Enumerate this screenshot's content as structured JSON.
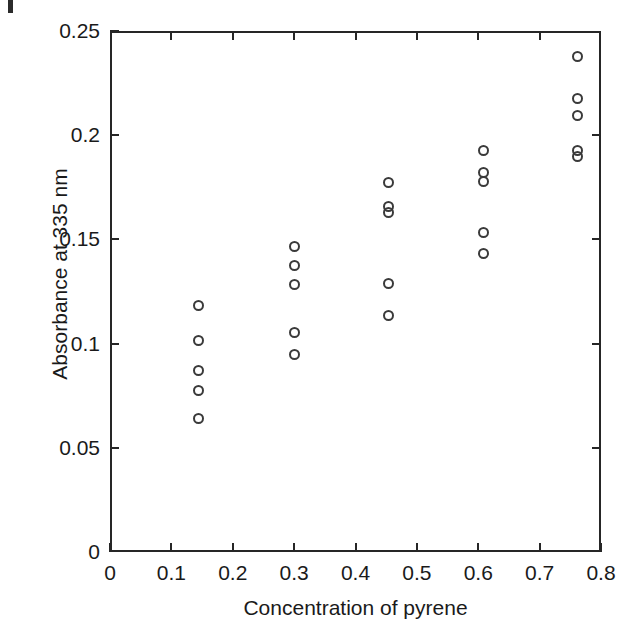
{
  "chart_data": {
    "type": "scatter",
    "title": "",
    "xlabel": "Concentration of pyrene",
    "ylabel": "Absorbance at 335 nm",
    "xlim": [
      0,
      0.8
    ],
    "ylim": [
      0,
      0.25
    ],
    "xticks": [
      0,
      0.1,
      0.2,
      0.3,
      0.4,
      0.5,
      0.6,
      0.7,
      0.8
    ],
    "xticklabels": [
      "0",
      "0.1",
      "0.2",
      "0.3",
      "0.4",
      "0.5",
      "0.6",
      "0.7",
      "0.8"
    ],
    "yticks": [
      0,
      0.05,
      0.1,
      0.15,
      0.2,
      0.25
    ],
    "yticklabels": [
      "0",
      "0.05",
      "0.1",
      "0.15",
      "0.2",
      "0.25"
    ],
    "grid": false,
    "legend": null,
    "marker": "open-circle",
    "marker_color": "#3a3a3a",
    "points": [
      {
        "x": 0.145,
        "y": 0.1185
      },
      {
        "x": 0.145,
        "y": 0.1015
      },
      {
        "x": 0.145,
        "y": 0.087
      },
      {
        "x": 0.145,
        "y": 0.0775
      },
      {
        "x": 0.145,
        "y": 0.064
      },
      {
        "x": 0.3,
        "y": 0.1465
      },
      {
        "x": 0.3,
        "y": 0.1375
      },
      {
        "x": 0.3,
        "y": 0.1285
      },
      {
        "x": 0.3,
        "y": 0.1055
      },
      {
        "x": 0.3,
        "y": 0.095
      },
      {
        "x": 0.453,
        "y": 0.1775
      },
      {
        "x": 0.453,
        "y": 0.166
      },
      {
        "x": 0.453,
        "y": 0.163
      },
      {
        "x": 0.453,
        "y": 0.129
      },
      {
        "x": 0.453,
        "y": 0.1135
      },
      {
        "x": 0.608,
        "y": 0.1925
      },
      {
        "x": 0.608,
        "y": 0.182
      },
      {
        "x": 0.608,
        "y": 0.178
      },
      {
        "x": 0.608,
        "y": 0.1535
      },
      {
        "x": 0.608,
        "y": 0.143
      },
      {
        "x": 0.762,
        "y": 0.238
      },
      {
        "x": 0.762,
        "y": 0.2175
      },
      {
        "x": 0.762,
        "y": 0.2095
      },
      {
        "x": 0.762,
        "y": 0.1925
      },
      {
        "x": 0.762,
        "y": 0.19
      }
    ],
    "series_note": "Five concentration levels with five replicate absorbance readings each"
  },
  "axes": {
    "x_title": "Concentration of pyrene",
    "y_title": "Absorbance at 335 nm"
  },
  "colors": {
    "axis": "#262626",
    "marker": "#3a3a3a",
    "text": "#1a1a1a",
    "background": "#ffffff"
  }
}
